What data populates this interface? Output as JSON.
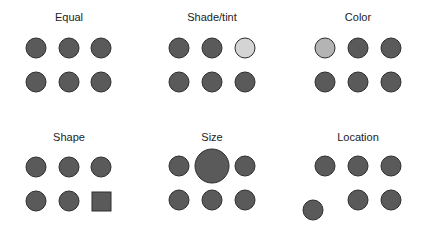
{
  "colors": {
    "dark": "#5a5a5a",
    "light_tint": "#d4d4d4",
    "color_variant": "#b4b4b4",
    "stroke": "#2e2e2e"
  },
  "panels": [
    {
      "title": "Equal",
      "variant": "none"
    },
    {
      "title": "Shade/tint",
      "variant": "lighter shade of top-right circle"
    },
    {
      "title": "Color",
      "variant": "different color of top-left circle"
    },
    {
      "title": "Shape",
      "variant": "bottom-right element is a square"
    },
    {
      "title": "Size",
      "variant": "top-middle circle is larger"
    },
    {
      "title": "Location",
      "variant": "bottom-left circle displaced"
    }
  ]
}
